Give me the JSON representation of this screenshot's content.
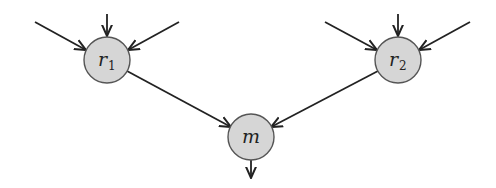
{
  "diagram": {
    "type": "tree-merge",
    "nodes": [
      {
        "id": "r1",
        "label": "r",
        "subscript": "1",
        "cx": 107,
        "cy": 60,
        "r": 23
      },
      {
        "id": "r2",
        "label": "r",
        "subscript": "2",
        "cx": 398,
        "cy": 60,
        "r": 23
      },
      {
        "id": "m",
        "label": "m",
        "subscript": "",
        "cx": 251,
        "cy": 137,
        "r": 23
      }
    ],
    "edges": [
      {
        "from": "input",
        "to": "r1",
        "direction": "left-diagonal"
      },
      {
        "from": "input",
        "to": "r1",
        "direction": "vertical"
      },
      {
        "from": "input",
        "to": "r1",
        "direction": "right-diagonal"
      },
      {
        "from": "input",
        "to": "r2",
        "direction": "left-diagonal"
      },
      {
        "from": "input",
        "to": "r2",
        "direction": "vertical"
      },
      {
        "from": "input",
        "to": "r2",
        "direction": "right-diagonal"
      },
      {
        "from": "r1",
        "to": "m"
      },
      {
        "from": "r2",
        "to": "m"
      },
      {
        "from": "m",
        "to": "output",
        "direction": "down"
      }
    ],
    "colors": {
      "node_fill": "#d6d6d6",
      "node_stroke": "#555555",
      "edge": "#222222"
    }
  }
}
